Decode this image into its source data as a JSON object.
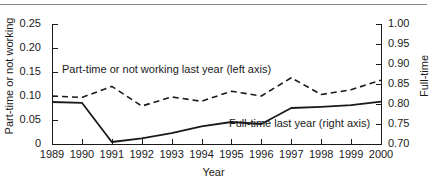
{
  "figure": {
    "background_color": "#ffffff",
    "line_color": "#1a1a1a",
    "top_rule_color": "#8a8a8a"
  },
  "chart_data": {
    "type": "line",
    "title": "",
    "xlabel": "Year",
    "ylabel": "Part-time or not working",
    "ylabel_right": "Full-time",
    "x": [
      1989,
      1990,
      1991,
      1992,
      1993,
      1994,
      1995,
      1996,
      1997,
      1998,
      1999,
      2000
    ],
    "xtick_labels": [
      "1989",
      "1990",
      "1991",
      "1992",
      "1993",
      "1994",
      "1995",
      "1996",
      "1997",
      "1998",
      "1999",
      "2000"
    ],
    "xlim": [
      1989,
      2000
    ],
    "ylim": [
      0,
      0.25
    ],
    "ytick_labels": [
      "0",
      "0.05",
      "0.10",
      "0.15",
      "0.20",
      "0.25"
    ],
    "ytick_values": [
      0,
      0.05,
      0.1,
      0.15,
      0.2,
      0.25
    ],
    "ylim_right": [
      0.7,
      1.0
    ],
    "ytick_labels_right": [
      "0.70",
      "0.75",
      "0.80",
      "0.85",
      "0.90",
      "0.95",
      "1.00"
    ],
    "ytick_values_right": [
      0.7,
      0.75,
      0.8,
      0.85,
      0.9,
      0.95,
      1.0
    ],
    "grid": false,
    "legend_position": "inline-annotations",
    "series": [
      {
        "name": "Part-time or not working last year (left axis)",
        "axis": "left",
        "style": "dashed",
        "values": [
          0.1,
          0.097,
          0.12,
          0.079,
          0.098,
          0.089,
          0.11,
          0.1,
          0.138,
          0.103,
          0.113,
          0.133
        ]
      },
      {
        "name": "Full-time last year (right axis)",
        "axis": "right",
        "style": "solid",
        "values": [
          0.805,
          0.803,
          0.705,
          0.714,
          0.727,
          0.744,
          0.755,
          0.75,
          0.79,
          0.793,
          0.797,
          0.806
        ]
      }
    ],
    "annotations": [
      {
        "text": "Part-time or not working last year (left axis)",
        "series": "Part-time or not working last year (left axis)"
      },
      {
        "text": "Full-time last year (right axis)",
        "series": "Full-time last year (right axis)"
      }
    ]
  }
}
